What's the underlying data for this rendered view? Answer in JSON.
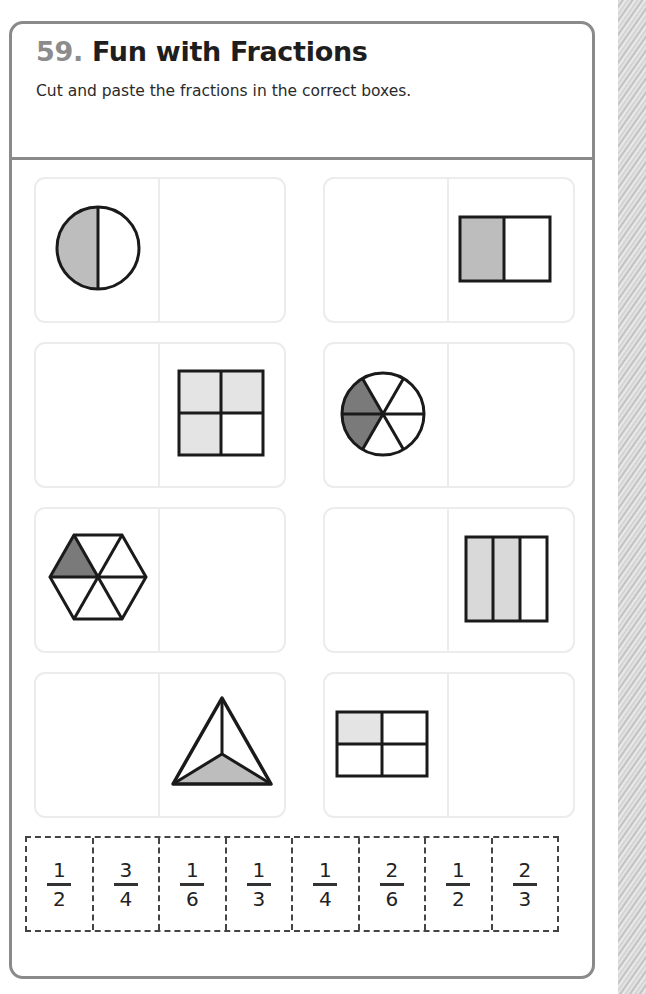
{
  "worksheet": {
    "number": "59.",
    "title": "Fun with Fractions",
    "instructions": "Cut and paste the fractions in the correct boxes."
  },
  "cards": [
    {
      "id": 1,
      "shape": "circle",
      "parts": 2,
      "shaded": 1,
      "shape_side": "left",
      "answer_box_side": "right",
      "shade_color": "#bdbdbd"
    },
    {
      "id": 2,
      "shape": "rectangle-2-columns",
      "parts": 2,
      "shaded": 1,
      "shape_side": "right",
      "answer_box_side": "left",
      "shade_color": "#bdbdbd"
    },
    {
      "id": 3,
      "shape": "square-2x2",
      "parts": 4,
      "shaded": 3,
      "shape_side": "right",
      "answer_box_side": "left",
      "shade_color": "#e4e4e4"
    },
    {
      "id": 4,
      "shape": "circle-6-sectors",
      "parts": 6,
      "shaded": 2,
      "shape_side": "left",
      "answer_box_side": "right",
      "shade_color": "#7a7a7a"
    },
    {
      "id": 5,
      "shape": "hexagon-6-triangles",
      "parts": 6,
      "shaded": 1,
      "shape_side": "left",
      "answer_box_side": "right",
      "shade_color": "#7a7a7a"
    },
    {
      "id": 6,
      "shape": "rectangle-3-columns",
      "parts": 3,
      "shaded": 2,
      "shape_side": "right",
      "answer_box_side": "left",
      "shade_color": "#d9d9d9"
    },
    {
      "id": 7,
      "shape": "triangle-3-parts",
      "parts": 3,
      "shaded": 1,
      "shape_side": "right",
      "answer_box_side": "left",
      "shade_color": "#bdbdbd"
    },
    {
      "id": 8,
      "shape": "rectangle-2x2",
      "parts": 4,
      "shaded": 1,
      "shape_side": "left",
      "answer_box_side": "right",
      "shade_color": "#e4e4e4"
    }
  ],
  "cutouts": [
    {
      "numerator": "1",
      "denominator": "2"
    },
    {
      "numerator": "3",
      "denominator": "4"
    },
    {
      "numerator": "1",
      "denominator": "6"
    },
    {
      "numerator": "1",
      "denominator": "3"
    },
    {
      "numerator": "1",
      "denominator": "4"
    },
    {
      "numerator": "2",
      "denominator": "6"
    },
    {
      "numerator": "1",
      "denominator": "2"
    },
    {
      "numerator": "2",
      "denominator": "3"
    }
  ],
  "colors": {
    "frame_border": "#8a8a8a",
    "title_number": "#8c8c8c",
    "title_text": "#1e1e1e",
    "card_border": "#ececec"
  }
}
